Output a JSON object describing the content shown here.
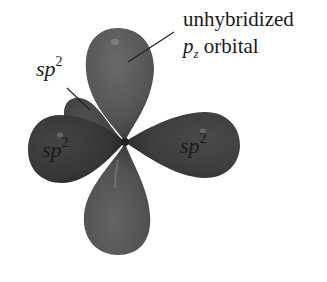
{
  "figure": {
    "colors": {
      "background": "#ffffff",
      "p_lobe": "#555555",
      "sp2_front_lobe": "#3a3a3a",
      "sp2_back_lobe": "#454545",
      "label_text": "#1a1a1a",
      "leader_line": "#222222"
    }
  },
  "labels": {
    "unhybridized_line1": "unhybridized",
    "pz_prefix": "p",
    "pz_subscript": "z",
    "pz_suffix": " orbital",
    "sp2_back": {
      "base": "sp",
      "sup": "2"
    },
    "sp2_left": {
      "base": "sp",
      "sup": "2"
    },
    "sp2_right": {
      "base": "sp",
      "sup": "2"
    }
  }
}
